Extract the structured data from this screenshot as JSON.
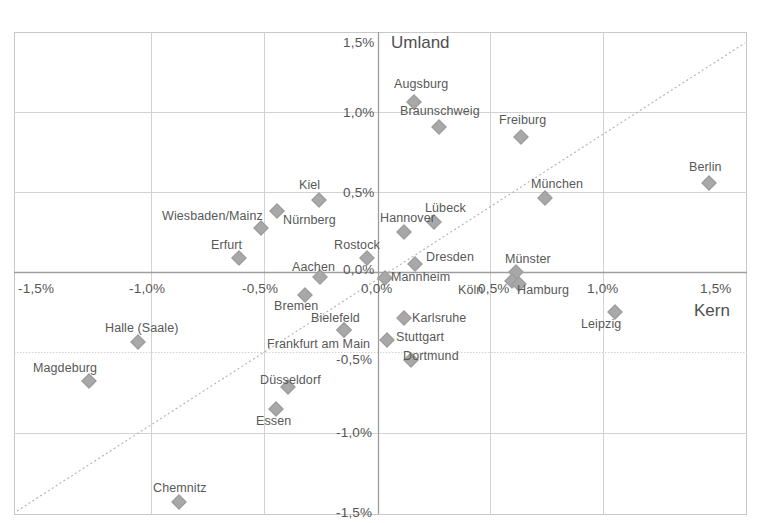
{
  "chart_data": {
    "type": "scatter",
    "title": "",
    "xlabel": "Kern",
    "ylabel": "Umland",
    "xlim": [
      -1.5,
      1.5
    ],
    "ylim": [
      -1.5,
      1.5
    ],
    "grid": true,
    "legend": "none",
    "xticks": [
      "-1,5%",
      "-1,0%",
      "-0,5%",
      "0,0%",
      "0,5%",
      "1,0%",
      "1,5%"
    ],
    "xtick_values": [
      -1.5,
      -1.0,
      -0.5,
      0.0,
      0.5,
      1.0,
      1.5
    ],
    "yticks": [
      "-1,5%",
      "-1,0%",
      "-0,5%",
      "0,0%",
      "0,5%",
      "1,0%",
      "1,5%"
    ],
    "ytick_values": [
      -1.5,
      -1.0,
      -0.5,
      0.0,
      0.5,
      1.0,
      1.5
    ],
    "reference_line": {
      "type": "dashed-diagonal",
      "from": [
        -1.5,
        -1.5
      ],
      "to": [
        1.5,
        1.5
      ]
    },
    "points": [
      {
        "label": "Augsburg",
        "x": 0.16,
        "y": 1.07,
        "lx": 394,
        "ly": 77
      },
      {
        "label": "Braunschweig",
        "x": 0.27,
        "y": 0.92,
        "lx": 400,
        "ly": 104
      },
      {
        "label": "Freiburg",
        "x": 0.63,
        "y": 0.85,
        "lx": 499,
        "ly": 113
      },
      {
        "label": "Berlin",
        "x": 1.47,
        "y": 0.56,
        "lx": 689,
        "ly": 160
      },
      {
        "label": "Kiel",
        "x": -0.26,
        "y": 0.46,
        "lx": 299,
        "ly": 178
      },
      {
        "label": "München",
        "x": 0.74,
        "y": 0.46,
        "lx": 531,
        "ly": 177
      },
      {
        "label": "Nürnberg",
        "x": -0.45,
        "y": 0.39,
        "lx": 283,
        "ly": 213
      },
      {
        "label": "Wiesbaden/Mainz",
        "x": -0.52,
        "y": 0.29,
        "lx": 162,
        "ly": 209
      },
      {
        "label": "Lübeck",
        "x": 0.25,
        "y": 0.31,
        "lx": 425,
        "ly": 201
      },
      {
        "label": "Hannover",
        "x": 0.11,
        "y": 0.25,
        "lx": 380,
        "ly": 211
      },
      {
        "label": "Erfurt",
        "x": -0.62,
        "y": 0.06,
        "lx": 211,
        "ly": 238
      },
      {
        "label": "Rostock",
        "x": -0.05,
        "y": 0.06,
        "lx": 334,
        "ly": 238
      },
      {
        "label": "Dresden",
        "x": 0.16,
        "y": -0.03,
        "lx": 426,
        "ly": 250
      },
      {
        "label": "Aachen",
        "x": -0.26,
        "y": -0.02,
        "lx": 292,
        "ly": 260
      },
      {
        "label": "Münster",
        "x": 0.61,
        "y": -0.01,
        "lx": 505,
        "ly": 252
      },
      {
        "label": "Mannheim",
        "x": 0.03,
        "y": -0.03,
        "lx": 391,
        "ly": 270
      },
      {
        "label": "Köln",
        "x": 0.58,
        "y": -0.06,
        "lx": 458,
        "ly": 283
      },
      {
        "label": "Hamburg",
        "x": 0.63,
        "y": -0.07,
        "lx": 517,
        "ly": 283
      },
      {
        "label": "Bremen",
        "x": -0.33,
        "y": -0.15,
        "lx": 274,
        "ly": 299
      },
      {
        "label": "Karlsruhe",
        "x": 0.11,
        "y": -0.3,
        "lx": 412,
        "ly": 311
      },
      {
        "label": "Leipzig",
        "x": 1.05,
        "y": -0.26,
        "lx": 581,
        "ly": 317
      },
      {
        "label": "Halle (Saale)",
        "x": -1.07,
        "y": -0.45,
        "lx": 105,
        "ly": 321
      },
      {
        "label": "Bielefeld",
        "x": -0.15,
        "y": -0.37,
        "lx": 311,
        "ly": 311
      },
      {
        "label": "Stuttgart",
        "x": 0.04,
        "y": -0.43,
        "lx": 396,
        "ly": 330
      },
      {
        "label": "Frankfurt am Main",
        "x": -0.15,
        "y": -0.37,
        "lx": 267,
        "ly": 337
      },
      {
        "label": "Dortmund",
        "x": 0.15,
        "y": -0.56,
        "lx": 403,
        "ly": 349
      },
      {
        "label": "Magdeburg",
        "x": -1.28,
        "y": -0.7,
        "lx": 33,
        "ly": 361
      },
      {
        "label": "Düsseldorf",
        "x": -0.4,
        "y": -0.73,
        "lx": 260,
        "ly": 373
      },
      {
        "label": "Essen",
        "x": -0.45,
        "y": -0.87,
        "lx": 256,
        "ly": 414
      },
      {
        "label": "Chemnitz",
        "x": -0.88,
        "y": -1.28,
        "lx": 153,
        "ly": 481
      }
    ],
    "marker_pixels": [
      {
        "label": "Augsburg",
        "px": 414,
        "py": 102
      },
      {
        "label": "Braunschweig",
        "px": 439,
        "py": 127
      },
      {
        "label": "Freiburg",
        "px": 521,
        "py": 137
      },
      {
        "label": "Berlin",
        "px": 709,
        "py": 183
      },
      {
        "label": "Kiel",
        "px": 319,
        "py": 200
      },
      {
        "label": "München",
        "px": 545,
        "py": 198
      },
      {
        "label": "Nürnberg",
        "px": 277,
        "py": 211
      },
      {
        "label": "Wiesbaden/Mainz",
        "px": 261,
        "py": 228
      },
      {
        "label": "Lübeck",
        "px": 434,
        "py": 222
      },
      {
        "label": "Hannover",
        "px": 404,
        "py": 232
      },
      {
        "label": "Erfurt",
        "px": 239,
        "py": 258
      },
      {
        "label": "Rostock",
        "px": 367,
        "py": 258
      },
      {
        "label": "Dresden",
        "px": 415,
        "py": 264
      },
      {
        "label": "Aachen",
        "px": 320,
        "py": 277
      },
      {
        "label": "Münster",
        "px": 516,
        "py": 272
      },
      {
        "label": "Mannheim",
        "px": 385,
        "py": 278
      },
      {
        "label": "Köln",
        "px": 512,
        "py": 281
      },
      {
        "label": "Hamburg",
        "px": 519,
        "py": 284
      },
      {
        "label": "Bremen",
        "px": 305,
        "py": 295
      },
      {
        "label": "Karlsruhe",
        "px": 404,
        "py": 318
      },
      {
        "label": "Leipzig",
        "px": 615,
        "py": 312
      },
      {
        "label": "Halle (Saale)",
        "px": 138,
        "py": 342
      },
      {
        "label": "Bielefeld",
        "px": 344,
        "py": 330
      },
      {
        "label": "Stuttgart",
        "px": 387,
        "py": 340
      },
      {
        "label": "Frankfurt am Main",
        "px": 344,
        "py": 330
      },
      {
        "label": "Dortmund",
        "px": 411,
        "py": 360
      },
      {
        "label": "Magdeburg",
        "px": 89,
        "py": 381
      },
      {
        "label": "Düsseldorf",
        "px": 288,
        "py": 387
      },
      {
        "label": "Essen",
        "px": 276,
        "py": 409
      },
      {
        "label": "Chemnitz",
        "px": 179,
        "py": 502
      }
    ],
    "axis_title_positions": {
      "umland": {
        "x": 391,
        "y": 33
      },
      "kern": {
        "x": 694,
        "y": 301
      }
    },
    "xtick_positions": [
      {
        "label": "-1,5%",
        "x": 18,
        "y": 281
      },
      {
        "label": "-1,0%",
        "x": 129,
        "y": 281
      },
      {
        "label": "-0,5%",
        "x": 242,
        "y": 281
      },
      {
        "label": "0,0%",
        "x": 361,
        "y": 281
      },
      {
        "label": "0,5%",
        "x": 478,
        "y": 281
      },
      {
        "label": "1,0%",
        "x": 587,
        "y": 281
      },
      {
        "label": "1,5%",
        "x": 700,
        "y": 281
      }
    ],
    "ytick_positions": [
      {
        "label": "1,5%",
        "x": 343,
        "y": 35
      },
      {
        "label": "1,0%",
        "x": 343,
        "y": 105
      },
      {
        "label": "0,5%",
        "x": 343,
        "y": 185
      },
      {
        "label": "0,0%",
        "x": 343,
        "y": 262
      },
      {
        "label": "-0,5%",
        "x": 336,
        "y": 352
      },
      {
        "label": "-1,0%",
        "x": 336,
        "y": 425
      },
      {
        "label": "-1,5%",
        "x": 336,
        "y": 505
      }
    ],
    "plot_area": {
      "left": 14,
      "top": 32,
      "right": 747,
      "bottom": 514
    },
    "colors": {
      "marker": "#a8a8a8",
      "grid": "#cfcfcf",
      "axis": "#9a9a9a",
      "text": "#585858",
      "background": "#ffffff"
    }
  }
}
